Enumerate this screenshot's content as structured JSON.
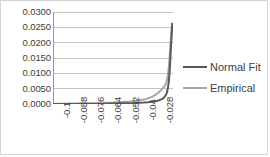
{
  "chart_data": {
    "type": "line",
    "title": "",
    "xlabel": "",
    "ylabel": "",
    "grid": true,
    "legend_position": "right",
    "xlim": [
      -0.106,
      -0.0225
    ],
    "ylim": [
      0.0,
      0.03
    ],
    "y_ticks": [
      "0.0300",
      "0.0250",
      "0.0200",
      "0.0150",
      "0.0100",
      "0.0050",
      "0.0000"
    ],
    "y_tick_values": [
      0.03,
      0.025,
      0.02,
      0.015,
      0.01,
      0.005,
      0
    ],
    "x_ticks": [
      "-0.1",
      "-0.088",
      "-0.076",
      "-0.064",
      "-0.052",
      "-0.04",
      "-0.028"
    ],
    "x_tick_values": [
      -0.1,
      -0.088,
      -0.076,
      -0.064,
      -0.052,
      -0.04,
      -0.028
    ],
    "series": [
      {
        "name": "Normal Fit",
        "color": "#595959",
        "x": [
          -0.106,
          -0.1,
          -0.094,
          -0.088,
          -0.082,
          -0.076,
          -0.07,
          -0.064,
          -0.058,
          -0.052,
          -0.046,
          -0.043,
          -0.04,
          -0.037,
          -0.034,
          -0.032,
          -0.03,
          -0.029,
          -0.028,
          -0.027,
          -0.0265,
          -0.026,
          -0.0255,
          -0.025,
          -0.0245,
          -0.024,
          -0.0235,
          -0.023
        ],
        "values": [
          2e-05,
          3e-05,
          4e-05,
          5e-05,
          7e-05,
          9e-05,
          0.00012,
          0.00016,
          0.00021,
          0.00028,
          0.00038,
          0.00046,
          0.00058,
          0.00075,
          0.001,
          0.00125,
          0.00165,
          0.002,
          0.00255,
          0.0034,
          0.0042,
          0.0054,
          0.007,
          0.0095,
          0.0132,
          0.018,
          0.022,
          0.0262
        ]
      },
      {
        "name": "Empirical",
        "color": "#a6a6a6",
        "x": [
          -0.106,
          -0.1,
          -0.094,
          -0.088,
          -0.082,
          -0.076,
          -0.072,
          -0.07,
          -0.068,
          -0.064,
          -0.06,
          -0.056,
          -0.052,
          -0.048,
          -0.044,
          -0.041,
          -0.038,
          -0.035,
          -0.033,
          -0.031,
          -0.029,
          -0.028,
          -0.027,
          -0.0265,
          -0.026,
          -0.0255,
          -0.025,
          -0.0245,
          -0.024,
          -0.0235,
          -0.023
        ],
        "values": [
          4e-05,
          6e-05,
          8e-05,
          0.00011,
          0.00014,
          0.00018,
          0.0002,
          0.0004,
          0.00042,
          0.00048,
          0.00058,
          0.0007,
          0.00085,
          0.00105,
          0.00135,
          0.00165,
          0.00215,
          0.0029,
          0.0036,
          0.0044,
          0.0054,
          0.0061,
          0.0072,
          0.0082,
          0.0096,
          0.0115,
          0.0142,
          0.0178,
          0.021,
          0.024,
          0.0262
        ]
      }
    ]
  },
  "legend": {
    "items": [
      {
        "label": "Normal Fit",
        "color": "#595959"
      },
      {
        "label": "Empirical",
        "color": "#a6a6a6"
      }
    ]
  },
  "colors": {
    "normal_fit": "#595959",
    "empirical": "#a6a6a6",
    "gridline": "#c6c6c6",
    "axis": "#9a9a9a",
    "border": "#d4d4d4",
    "text": "#404040"
  }
}
